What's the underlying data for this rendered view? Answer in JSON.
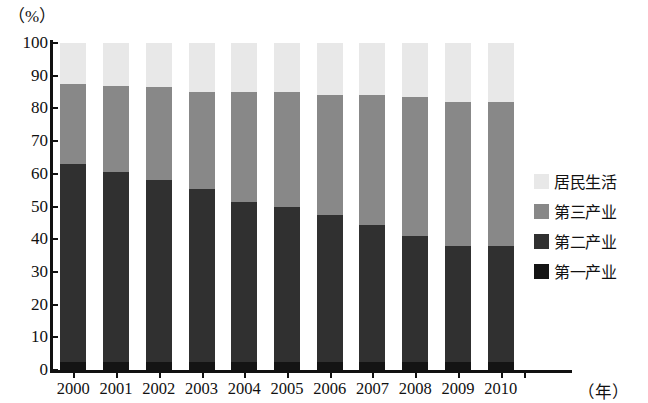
{
  "chart_data": {
    "type": "bar",
    "subtype": "stacked-bar-100-percent",
    "title": "",
    "xlabel": "（年）",
    "ylabel": "（%）",
    "ylim": [
      0,
      100
    ],
    "yticks": [
      0,
      10,
      20,
      30,
      40,
      50,
      60,
      70,
      80,
      90,
      100
    ],
    "ytick_labels": [
      "0",
      "10",
      "20",
      "30",
      "40",
      "50",
      "60",
      "70",
      "80",
      "90",
      "100"
    ],
    "grid": false,
    "legend_position": "right",
    "categories": [
      "2000",
      "2001",
      "2002",
      "2003",
      "2004",
      "2005",
      "2006",
      "2007",
      "2008",
      "2009",
      "2010"
    ],
    "series": [
      {
        "name": "第一产业",
        "color": "#141414",
        "values": [
          2.5,
          2.5,
          2.5,
          2.5,
          2.5,
          2.5,
          2.5,
          2.5,
          2.5,
          2.5,
          2.5
        ]
      },
      {
        "name": "第二产业",
        "color": "#303030",
        "values": [
          60.5,
          58.0,
          55.5,
          53.0,
          49.0,
          47.5,
          45.0,
          42.0,
          38.5,
          35.5,
          35.5
        ]
      },
      {
        "name": "第三产业",
        "color": "#888888",
        "values": [
          24.5,
          26.5,
          28.5,
          29.5,
          33.5,
          35.0,
          36.5,
          39.5,
          42.5,
          44.0,
          44.0
        ]
      },
      {
        "name": "居民生活",
        "color": "#e8e8e8",
        "values": [
          12.5,
          13.0,
          13.5,
          15.0,
          15.0,
          15.0,
          16.0,
          16.0,
          16.5,
          18.0,
          18.0
        ]
      }
    ],
    "cumulative_tops": {
      "第一产业": [
        2.5,
        2.5,
        2.5,
        2.5,
        2.5,
        2.5,
        2.5,
        2.5,
        2.5,
        2.5,
        2.5
      ],
      "第二产业": [
        63.0,
        60.5,
        58.0,
        55.5,
        51.5,
        50.0,
        47.5,
        44.5,
        41.0,
        38.0,
        38.0
      ],
      "第三产业": [
        87.5,
        87.0,
        86.5,
        85.0,
        85.0,
        85.0,
        84.0,
        84.0,
        83.5,
        82.0,
        82.0
      ],
      "居民生活": [
        100,
        100,
        100,
        100,
        100,
        100,
        100,
        100,
        100,
        100,
        100
      ]
    }
  },
  "legend": {
    "items": [
      {
        "label": "居民生活",
        "color": "#e8e8e8"
      },
      {
        "label": "第三产业",
        "color": "#888888"
      },
      {
        "label": "第二产业",
        "color": "#303030"
      },
      {
        "label": "第一产业",
        "color": "#141414"
      }
    ]
  }
}
